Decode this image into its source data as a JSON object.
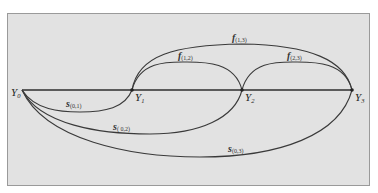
{
  "colors": {
    "background": "#ffffff",
    "panel": "#e2e2e2",
    "panel_border": "#9a9a9a",
    "line": "#3a3a3a"
  },
  "nodes": [
    {
      "id": "Y0",
      "base": "Y",
      "sub": "0"
    },
    {
      "id": "Y1",
      "base": "Y",
      "sub": "1"
    },
    {
      "id": "Y2",
      "base": "Y",
      "sub": "2"
    },
    {
      "id": "Y3",
      "base": "Y",
      "sub": "3"
    }
  ],
  "edges_above": [
    {
      "id": "f12",
      "base": "f",
      "sub": "(1,2)",
      "from": "Y1",
      "to": "Y2"
    },
    {
      "id": "f23",
      "base": "f",
      "sub": "(2,3)",
      "from": "Y2",
      "to": "Y3"
    },
    {
      "id": "f13",
      "base": "f",
      "sub": "(1,3)",
      "from": "Y1",
      "to": "Y3"
    }
  ],
  "edges_below": [
    {
      "id": "s01",
      "base": "s",
      "sub": "(0,1)",
      "from": "Y0",
      "to": "Y1"
    },
    {
      "id": "s02",
      "base": "s",
      "sub": "( 0,2)",
      "from": "Y0",
      "to": "Y2"
    },
    {
      "id": "s03",
      "base": "s",
      "sub": "(0,3)",
      "from": "Y0",
      "to": "Y3"
    }
  ]
}
